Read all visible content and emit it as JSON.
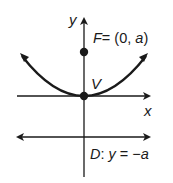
{
  "diagram": {
    "axes": {
      "x_label": "x",
      "y_label": "y"
    },
    "focus": {
      "name": "F",
      "coords_text": "= (0, ",
      "param": "a",
      "close": ")"
    },
    "vertex": {
      "name": "V"
    },
    "directrix": {
      "name": "D",
      "eq_prefix": ": ",
      "var": "y",
      "eq_mid": " = −",
      "param": "a"
    },
    "colors": {
      "stroke": "#1a1a1a",
      "background": "#ffffff"
    }
  }
}
